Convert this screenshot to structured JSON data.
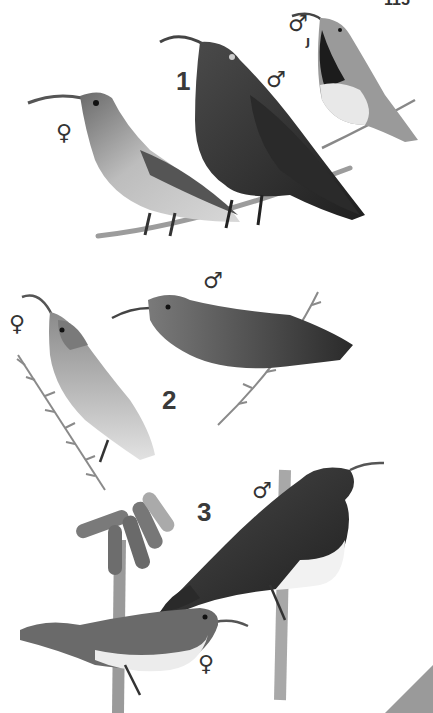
{
  "page": {
    "page_number": "115",
    "corner_tab_color": "#9a9a9a"
  },
  "plates": [
    {
      "number": "1",
      "birds": [
        {
          "sex": "♀",
          "description": "female sunbird, streaked breast, long curved bill, perched on twig"
        },
        {
          "sex": "♂",
          "description": "male sunbird, dark scaly plumage, long curved bill, perched on twig"
        },
        {
          "sex": "♂",
          "qualifier": "J",
          "description": "juvenile male sunbird, dark throat, pale belly, perched on twig"
        }
      ]
    },
    {
      "number": "2",
      "birds": [
        {
          "sex": "♀",
          "description": "female sunbird, pale underparts, perched on leafy stem"
        },
        {
          "sex": "♂",
          "description": "male sunbird, uniform dark plumage, perched on leafy stem"
        }
      ]
    },
    {
      "number": "3",
      "birds": [
        {
          "sex": "♂",
          "description": "male sunbird, black head and back, white belly, perched on aloe stalk"
        },
        {
          "sex": "♀",
          "description": "female sunbird, olive-brown upperparts, white underparts, perched on aloe stalk"
        }
      ],
      "plant": "aloe flower spike with tubular blooms"
    }
  ]
}
